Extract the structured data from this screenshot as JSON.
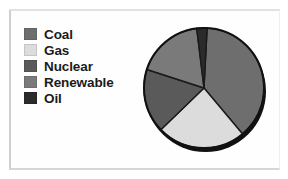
{
  "chart_data": {
    "type": "pie",
    "title": "",
    "labels": [
      "Coal",
      "Gas",
      "Nuclear",
      "Renewable",
      "Oil"
    ],
    "values": [
      38,
      24,
      17,
      18,
      3
    ],
    "units": "percent",
    "colors": [
      "#6e6e6e",
      "#dcdcdc",
      "#5a5a5a",
      "#7a7a7a",
      "#2b2b2b"
    ],
    "start_angle_deg": 3,
    "direction": "clockwise",
    "legend_position": "left",
    "grid": false,
    "xlabel": "",
    "ylabel": "",
    "slices": [
      {
        "label": "Coal",
        "value": 38,
        "color": "#6e6e6e",
        "start_deg": 3,
        "end_deg": 140
      },
      {
        "label": "Gas",
        "value": 24,
        "color": "#dcdcdc",
        "start_deg": 140,
        "end_deg": 226
      },
      {
        "label": "Nuclear",
        "value": 17,
        "color": "#5a5a5a",
        "start_deg": 226,
        "end_deg": 288
      },
      {
        "label": "Renewable",
        "value": 18,
        "color": "#7a7a7a",
        "start_deg": 288,
        "end_deg": 353
      },
      {
        "label": "Oil",
        "value": 3,
        "color": "#2b2b2b",
        "start_deg": 353,
        "end_deg": 363
      }
    ]
  },
  "legend": {
    "items": [
      {
        "label": "Coal",
        "swatch_color": "#6e6e6e",
        "icon": "legend-swatch-icon"
      },
      {
        "label": "Gas",
        "swatch_color": "#dcdcdc",
        "icon": "legend-swatch-icon"
      },
      {
        "label": "Nuclear",
        "swatch_color": "#5a5a5a",
        "icon": "legend-swatch-icon"
      },
      {
        "label": "Renewable",
        "swatch_color": "#7a7a7a",
        "icon": "legend-swatch-icon"
      },
      {
        "label": "Oil",
        "swatch_color": "#2b2b2b",
        "icon": "legend-swatch-icon"
      }
    ]
  },
  "style": {
    "background": "#ffffff",
    "frame_border": "#cfcfcf",
    "pie_outline": "#111111",
    "slice_divider": "#1a1a1a"
  }
}
